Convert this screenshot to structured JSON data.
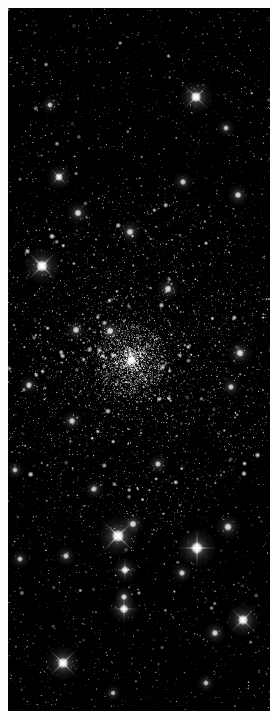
{
  "image": {
    "subject_name": "globular star cluster",
    "domain_label": "Natural-Image",
    "orientation": "portrait",
    "width_px": 270,
    "height_px": 724,
    "color_mode": "grayscale",
    "background_color": "#000000",
    "border_color": "#fefefe",
    "star_color": "#ffffff",
    "core_glow_color": "#fafafa",
    "halo_glow_color": "#a8a8a8",
    "plate": {
      "left_px": 8,
      "top_px": 8,
      "width_px": 262,
      "height_px": 703
    },
    "cluster": {
      "center_x_px": 131,
      "center_y_px": 360,
      "nucleus_radius_px": 36,
      "core_radius_px": 70,
      "halo_radius_px": 150
    },
    "star_counts": {
      "unresolved_field": 5200,
      "cluster_members": 6400,
      "bright_foreground": 34
    },
    "bright_stars": [
      {
        "id": "star-01",
        "x": 196,
        "y": 97,
        "radius": 4.0,
        "spike_style": "x",
        "brightness": 1.0
      },
      {
        "id": "star-02",
        "x": 42,
        "y": 266,
        "radius": 4.4,
        "spike_style": "x",
        "brightness": 1.0
      },
      {
        "id": "star-03",
        "x": 118,
        "y": 536,
        "radius": 4.8,
        "spike_style": "x",
        "brightness": 1.0
      },
      {
        "id": "star-04",
        "x": 197,
        "y": 548,
        "radius": 4.6,
        "spike_style": "plus",
        "brightness": 1.0
      },
      {
        "id": "star-05",
        "x": 63,
        "y": 663,
        "radius": 4.2,
        "spike_style": "x",
        "brightness": 0.96
      },
      {
        "id": "star-06",
        "x": 243,
        "y": 620,
        "radius": 4.0,
        "spike_style": "x",
        "brightness": 0.94
      },
      {
        "id": "star-07",
        "x": 124,
        "y": 609,
        "radius": 3.4,
        "spike_style": "plus",
        "brightness": 0.88
      },
      {
        "id": "star-08",
        "x": 124,
        "y": 597,
        "radius": 2.4,
        "spike_style": "none",
        "brightness": 0.8
      },
      {
        "id": "star-09",
        "x": 125,
        "y": 570,
        "radius": 3.0,
        "spike_style": "plus",
        "brightness": 0.84
      },
      {
        "id": "star-10",
        "x": 228,
        "y": 527,
        "radius": 3.0,
        "spike_style": "none",
        "brightness": 0.82
      },
      {
        "id": "star-11",
        "x": 215,
        "y": 633,
        "radius": 2.6,
        "spike_style": "none",
        "brightness": 0.78
      },
      {
        "id": "star-12",
        "x": 133,
        "y": 524,
        "radius": 2.8,
        "spike_style": "none",
        "brightness": 0.8
      },
      {
        "id": "star-13",
        "x": 182,
        "y": 573,
        "radius": 2.4,
        "spike_style": "none",
        "brightness": 0.76
      },
      {
        "id": "star-14",
        "x": 66,
        "y": 556,
        "radius": 2.4,
        "spike_style": "none",
        "brightness": 0.74
      },
      {
        "id": "star-15",
        "x": 20,
        "y": 559,
        "radius": 2.2,
        "spike_style": "none",
        "brightness": 0.72
      },
      {
        "id": "star-16",
        "x": 59,
        "y": 177,
        "radius": 3.0,
        "spike_style": "x",
        "brightness": 0.86
      },
      {
        "id": "star-17",
        "x": 78,
        "y": 213,
        "radius": 2.8,
        "spike_style": "none",
        "brightness": 0.82
      },
      {
        "id": "star-18",
        "x": 130,
        "y": 232,
        "radius": 2.8,
        "spike_style": "none",
        "brightness": 0.8
      },
      {
        "id": "star-19",
        "x": 183,
        "y": 182,
        "radius": 2.4,
        "spike_style": "none",
        "brightness": 0.74
      },
      {
        "id": "star-20",
        "x": 238,
        "y": 195,
        "radius": 2.6,
        "spike_style": "none",
        "brightness": 0.78
      },
      {
        "id": "star-21",
        "x": 168,
        "y": 289,
        "radius": 2.8,
        "spike_style": "none",
        "brightness": 0.8
      },
      {
        "id": "star-22",
        "x": 110,
        "y": 331,
        "radius": 2.8,
        "spike_style": "none",
        "brightness": 0.82
      },
      {
        "id": "star-23",
        "x": 76,
        "y": 330,
        "radius": 2.6,
        "spike_style": "none",
        "brightness": 0.78
      },
      {
        "id": "star-24",
        "x": 240,
        "y": 353,
        "radius": 3.0,
        "spike_style": "none",
        "brightness": 0.82
      },
      {
        "id": "star-25",
        "x": 231,
        "y": 387,
        "radius": 2.4,
        "spike_style": "none",
        "brightness": 0.74
      },
      {
        "id": "star-26",
        "x": 29,
        "y": 385,
        "radius": 2.4,
        "spike_style": "none",
        "brightness": 0.74
      },
      {
        "id": "star-27",
        "x": 72,
        "y": 421,
        "radius": 2.6,
        "spike_style": "none",
        "brightness": 0.76
      },
      {
        "id": "star-28",
        "x": 50,
        "y": 105,
        "radius": 2.2,
        "spike_style": "none",
        "brightness": 0.7
      },
      {
        "id": "star-29",
        "x": 226,
        "y": 128,
        "radius": 2.2,
        "spike_style": "none",
        "brightness": 0.7
      },
      {
        "id": "star-30",
        "x": 158,
        "y": 464,
        "radius": 2.4,
        "spike_style": "none",
        "brightness": 0.74
      },
      {
        "id": "star-31",
        "x": 94,
        "y": 489,
        "radius": 2.4,
        "spike_style": "none",
        "brightness": 0.72
      },
      {
        "id": "star-32",
        "x": 15,
        "y": 470,
        "radius": 2.2,
        "spike_style": "none",
        "brightness": 0.7
      },
      {
        "id": "star-33",
        "x": 206,
        "y": 683,
        "radius": 2.2,
        "spike_style": "none",
        "brightness": 0.68
      },
      {
        "id": "star-34",
        "x": 113,
        "y": 693,
        "radius": 2.0,
        "spike_style": "none",
        "brightness": 0.66
      }
    ]
  }
}
